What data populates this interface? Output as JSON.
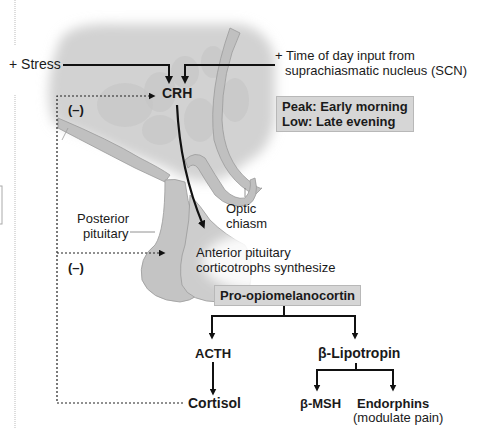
{
  "diagram": {
    "inputs": {
      "stress": "+ Stress",
      "scn_line1": "+ Time of day input from",
      "scn_line2": "suprachiasmatic nucleus (SCN)"
    },
    "hypothalamus_hormone": "CRH",
    "feedback": {
      "upper": "(–)",
      "lower": "(–)"
    },
    "circadian_box": {
      "line1": "Peak: Early morning",
      "line2": "Low: Late evening"
    },
    "anatomy": {
      "optic_chiasm_line1": "Optic",
      "optic_chiasm_line2": "chiasm",
      "posterior_line1": "Posterior",
      "posterior_line2": "pituitary",
      "anterior_line1": "Anterior pituitary",
      "anterior_line2": "corticotrophs synthesize"
    },
    "precursor": "Pro-opiomelanocortin",
    "products": {
      "acth": "ACTH",
      "lipotropin": "β-Lipotropin",
      "cortisol": "Cortisol",
      "msh": "β-MSH",
      "endorphins": "Endorphins",
      "endorphins_note": "(modulate pain)"
    },
    "colors": {
      "tissue_fill": "#c8c8c8",
      "tissue_light": "#dcdcdc",
      "box_fill": "#d6d6d6",
      "arrow": "#111111"
    }
  }
}
